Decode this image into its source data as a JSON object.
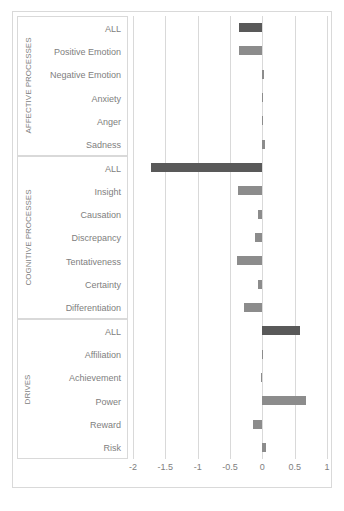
{
  "chart_data": {
    "type": "bar",
    "orientation": "horizontal",
    "title": "",
    "xlabel": "",
    "ylabel": "",
    "xlim": [
      -2,
      1
    ],
    "grid": true,
    "legend": false,
    "xticks": [
      -2,
      -1.5,
      -1,
      -0.5,
      0,
      0.5,
      1
    ],
    "xtick_labels": [
      "-2",
      "-1.5",
      "-1",
      "-0.5",
      "0",
      "0.5",
      "1"
    ],
    "colors": {
      "all_bar": "#595959",
      "sub_bar": "#8c8c8c",
      "gridline": "#d9d9d9",
      "frame": "#d9d9d9",
      "text": "#808080"
    },
    "groups": [
      {
        "name": "AFFECTIVE PROCESSES",
        "categories": [
          "ALL",
          "Positive Emotion",
          "Negative Emotion",
          "Anxiety",
          "Anger",
          "Sadness"
        ],
        "values": [
          -0.36,
          -0.36,
          0.03,
          0.0,
          -0.01,
          0.04
        ],
        "emphasis": [
          true,
          false,
          false,
          false,
          false,
          false
        ]
      },
      {
        "name": "COGNITIVE PROCESSES",
        "categories": [
          "ALL",
          "Insight",
          "Causation",
          "Discrepancy",
          "Tentativeness",
          "Certainty",
          "Differentiation"
        ],
        "values": [
          -1.72,
          -0.37,
          -0.06,
          -0.12,
          -0.39,
          -0.07,
          -0.29
        ],
        "emphasis": [
          true,
          false,
          false,
          false,
          false,
          false,
          false
        ]
      },
      {
        "name": "DRIVES",
        "categories": [
          "ALL",
          "Affiliation",
          "Achievement",
          "Power",
          "Reward",
          "Risk"
        ],
        "values": [
          0.59,
          -0.01,
          -0.02,
          0.67,
          -0.14,
          0.05
        ],
        "emphasis": [
          true,
          false,
          false,
          false,
          false,
          false
        ]
      }
    ]
  }
}
